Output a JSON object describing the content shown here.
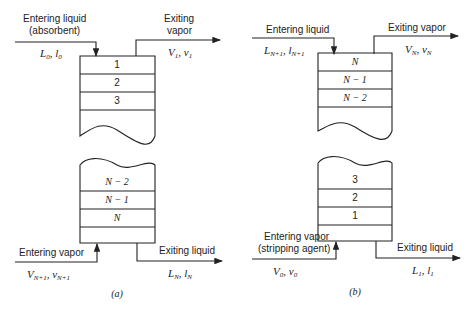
{
  "diagram_a": {
    "caption": "(a)",
    "entering_liquid": {
      "label_line1": "Entering liquid",
      "label_line2": "(absorbent)",
      "var": "L",
      "var_sub": "0",
      "var2": "l",
      "var2_sub": "0"
    },
    "exiting_vapor": {
      "label_line1": "Exiting",
      "label_line2": "vapor",
      "var": "V",
      "var_sub": "1",
      "var2": "v",
      "var2_sub": "1"
    },
    "entering_vapor": {
      "label": "Entering vapor",
      "var": "V",
      "var_sub": "N+1",
      "var2": "v",
      "var2_sub": "N+1"
    },
    "exiting_liquid": {
      "label": "Exiting liquid",
      "var": "L",
      "var_sub": "N",
      "var2": "l",
      "var2_sub": "N"
    },
    "top_stages": [
      "1",
      "2",
      "3"
    ],
    "bottom_stages": [
      "N − 2",
      "N − 1",
      "N"
    ]
  },
  "diagram_b": {
    "caption": "(b)",
    "entering_liquid": {
      "label": "Entering liquid",
      "var": "L",
      "var_sub": "N+1",
      "var2": "l",
      "var2_sub": "N+1"
    },
    "exiting_vapor": {
      "label": "Exiting vapor",
      "var": "V",
      "var_sub": "N",
      "var2": "v",
      "var2_sub": "N"
    },
    "entering_vapor": {
      "label_line1": "Entering vapor",
      "label_line2": "(stripping agent)",
      "var": "V",
      "var_sub": "0",
      "var2": "v",
      "var2_sub": "0"
    },
    "exiting_liquid": {
      "label": "Exiting liquid",
      "var": "L",
      "var_sub": "1",
      "var2": "l",
      "var2_sub": "1"
    },
    "top_stages": [
      "N",
      "N − 1",
      "N − 2"
    ],
    "bottom_stages": [
      "3",
      "2",
      "1"
    ]
  }
}
